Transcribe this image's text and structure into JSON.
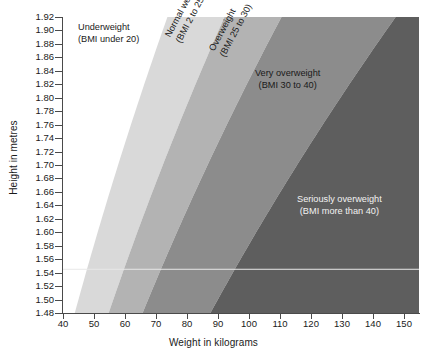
{
  "chart_data": {
    "type": "area",
    "title": "",
    "xlabel": "Weight in kilograms",
    "ylabel": "Height in metres",
    "xlim": [
      40,
      155
    ],
    "ylim": [
      1.48,
      1.92
    ],
    "xticks": [
      40,
      50,
      60,
      70,
      80,
      90,
      100,
      110,
      120,
      130,
      140,
      150
    ],
    "yticks": [
      1.48,
      1.5,
      1.52,
      1.54,
      1.56,
      1.58,
      1.6,
      1.62,
      1.64,
      1.66,
      1.68,
      1.7,
      1.72,
      1.74,
      1.76,
      1.78,
      1.8,
      1.82,
      1.84,
      1.86,
      1.88,
      1.9,
      1.92
    ],
    "grid": false,
    "legend": "none",
    "bmi_boundaries": [
      20,
      25,
      30,
      40
    ],
    "bands": [
      {
        "name": "Underweight",
        "bmi_min": null,
        "bmi_max": 20,
        "color": "#ffffff",
        "text_color": "#1a1a1a"
      },
      {
        "name": "Normal weight",
        "bmi_min": 20,
        "bmi_max": 25,
        "color": "#d9d9d9",
        "text_color": "#1a1a1a"
      },
      {
        "name": "Overweight",
        "bmi_min": 25,
        "bmi_max": 30,
        "color": "#b3b3b3",
        "text_color": "#1a1a1a"
      },
      {
        "name": "Very overweight",
        "bmi_min": 30,
        "bmi_max": 40,
        "color": "#8c8c8c",
        "text_color": "#1a1a1a"
      },
      {
        "name": "Seriously overweight",
        "bmi_min": 40,
        "bmi_max": null,
        "color": "#5e5e5e",
        "text_color": "#f2f2f2"
      }
    ],
    "reference_line": {
      "y": 1.545,
      "color": "#e8e8e8"
    }
  },
  "axes": {
    "x_title": "Weight in kilograms",
    "y_title": "Height in metres",
    "x_tick_labels": [
      "40",
      "50",
      "60",
      "70",
      "80",
      "90",
      "100",
      "110",
      "120",
      "130",
      "140",
      "150"
    ],
    "y_tick_labels": [
      "1.48",
      "1.50",
      "1.52",
      "1.54",
      "1.56",
      "1.58",
      "1.60",
      "1.62",
      "1.64",
      "1.66",
      "1.68",
      "1.70",
      "1.72",
      "1.74",
      "1.76",
      "1.78",
      "1.80",
      "1.82",
      "1.84",
      "1.86",
      "1.88",
      "1.90",
      "1.92"
    ]
  },
  "annotations": {
    "underweight": {
      "line1": "Underweight",
      "line2": "(BMI under 20)"
    },
    "normal_weight": {
      "line1": "Normal weight",
      "line2": "(BMI 2 to 25)"
    },
    "overweight": {
      "line1": "Overweight",
      "line2": "(BMI 25 to 30)"
    },
    "very_overweight": {
      "line1": "Very overweight",
      "line2": "(BMI 30 to 40)"
    },
    "seriously_overweight": {
      "line1": "Seriously overweight",
      "line2": "(BMI more than 40)"
    }
  }
}
